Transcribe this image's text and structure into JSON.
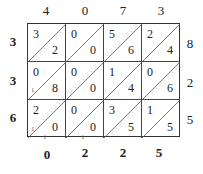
{
  "lattice": {
    "top_digits": [
      "4",
      "0",
      "7",
      "3"
    ],
    "right_digits": [
      "8",
      "2",
      "5"
    ],
    "left_digits": [
      "3",
      "3",
      "6"
    ],
    "bottom_digits": [
      "0",
      "2",
      "2",
      "5"
    ],
    "cells": [
      [
        {
          "tens": "3",
          "ones": "2"
        },
        {
          "tens": "0",
          "ones": "0"
        },
        {
          "tens": "5",
          "ones": "6"
        },
        {
          "tens": "2",
          "ones": "4"
        }
      ],
      [
        {
          "tens": "0",
          "ones": "8"
        },
        {
          "tens": "0",
          "ones": "0"
        },
        {
          "tens": "1",
          "ones": "4"
        },
        {
          "tens": "0",
          "ones": "6"
        }
      ],
      [
        {
          "tens": "2",
          "ones": "0"
        },
        {
          "tens": "0",
          "ones": "0"
        },
        {
          "tens": "3",
          "ones": "5"
        },
        {
          "tens": "1",
          "ones": "5"
        }
      ]
    ],
    "carries": [
      "1",
      "1",
      "1",
      "1"
    ]
  }
}
